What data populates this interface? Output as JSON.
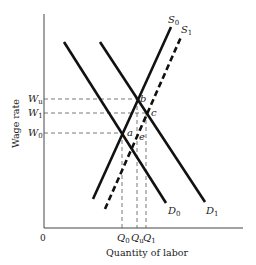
{
  "diagram": {
    "type": "supply-demand",
    "axes": {
      "y_label": "Wage rate",
      "x_label": "Quantity of labor",
      "origin_label": "0"
    },
    "wage_levels": [
      {
        "name": "W",
        "sub": "u",
        "id": "Wu"
      },
      {
        "name": "W",
        "sub": "1",
        "id": "W1"
      },
      {
        "name": "W",
        "sub": "0",
        "id": "W0"
      }
    ],
    "quantity_levels": [
      {
        "name": "Q",
        "sub": "0",
        "id": "Q0"
      },
      {
        "name": "Q",
        "sub": "u",
        "id": "Qu"
      },
      {
        "name": "Q",
        "sub": "1",
        "id": "Q1"
      }
    ],
    "curves": [
      {
        "name": "S",
        "sub": "0",
        "id": "S0",
        "style": "solid"
      },
      {
        "name": "S",
        "sub": "1",
        "id": "S1",
        "style": "dashed"
      },
      {
        "name": "D",
        "sub": "0",
        "id": "D0",
        "style": "solid"
      },
      {
        "name": "D",
        "sub": "1",
        "id": "D1",
        "style": "solid"
      }
    ],
    "points": [
      {
        "label": "a"
      },
      {
        "label": "b"
      },
      {
        "label": "c"
      },
      {
        "label": "e"
      }
    ],
    "colors": {
      "line": "#111111",
      "guide": "#555555",
      "background": "#ffffff"
    }
  }
}
